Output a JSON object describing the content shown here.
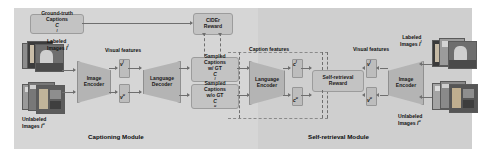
{
  "figure": {
    "type": "architecture-diagram",
    "modules": [
      {
        "id": "captioning",
        "caption": "Captioning Module"
      },
      {
        "id": "self-retrieval",
        "caption": "Self-retrieval Module"
      }
    ]
  },
  "captioning": {
    "ground_truth_captions": {
      "line1": "Ground-truth",
      "line2": "Captions",
      "symbol": "C",
      "sup": "l"
    },
    "cider_reward": {
      "line1": "CIDEr",
      "line2": "Reward"
    },
    "labeled_images": {
      "line1": "Labeled",
      "line2": "Images",
      "symbol": "I",
      "sup": "l"
    },
    "unlabeled_images": {
      "line1": "Unlabeled",
      "line2": "Images",
      "symbol": "I",
      "sup": "u"
    },
    "image_encoder": {
      "line1": "Image",
      "line2": "Encoder"
    },
    "language_decoder": {
      "line1": "Language",
      "line2": "Decoder"
    },
    "visual_features_label": "Visual features",
    "feature_labeled": {
      "symbol": "v",
      "sup": "l"
    },
    "feature_unlabeled": {
      "symbol": "v",
      "sup": "u"
    },
    "sampled_with_gt": {
      "line1": "Sampled",
      "line2": "Captions",
      "line3": "w/ GT",
      "symbol": "C",
      "sup": "l"
    },
    "sampled_without_gt": {
      "line1": "Sampled",
      "line2": "Captions",
      "line3": "w/o GT",
      "symbol": "C",
      "sup": "u"
    },
    "caption": "Captioning Module"
  },
  "retrieval": {
    "language_encoder": {
      "line1": "Language",
      "line2": "Encoder"
    },
    "self_retrieval_reward": {
      "line1": "Self-retrieval",
      "line2": "Reward"
    },
    "image_encoder": {
      "line1": "Image",
      "line2": "Encoder"
    },
    "caption_features_label": "Caption features",
    "visual_features_label": "Visual features",
    "feature_caption_labeled": {
      "symbol": "c",
      "sup": "l"
    },
    "feature_caption_unlabeled": {
      "symbol": "c",
      "sup": "u"
    },
    "feature_visual_labeled": {
      "symbol": "v",
      "sup": "l"
    },
    "feature_visual_unlabeled": {
      "symbol": "v",
      "sup": "u"
    },
    "labeled_images": {
      "line1": "Labeled",
      "line2": "Images",
      "symbol": "I",
      "sup": "l"
    },
    "unlabeled_images": {
      "line1": "Unlabeled",
      "line2": "Images",
      "symbol": "I",
      "sup": "u"
    },
    "caption": "Self-retrieval Module"
  },
  "colors": {
    "panel_left": "#d6d6d6",
    "panel_right": "#cfcfcf",
    "box_fill": "#c3c3c3",
    "trapezoid_fill": "#b4b4b4",
    "feature_fill": "#bdbdbd",
    "connector": "#6f6f6f",
    "text": "#111111"
  }
}
